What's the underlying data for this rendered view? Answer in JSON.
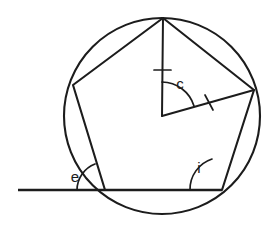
{
  "figure": {
    "type": "inscribed-regular-pentagon-with-angles",
    "background_color": "#ffffff",
    "stroke_color": "#1c1c1c"
  },
  "circle": {
    "center_x": 162,
    "center_y": 116,
    "radius": 98
  },
  "pentagon": {
    "vertex_count": 5,
    "vertices": [
      {
        "name": "apex",
        "x": 163,
        "y": 18
      },
      {
        "name": "upper-right",
        "x": 254,
        "y": 90
      },
      {
        "name": "lower-right",
        "x": 222,
        "y": 190
      },
      {
        "name": "lower-left",
        "x": 105,
        "y": 190
      },
      {
        "name": "upper-left",
        "x": 73,
        "y": 85
      }
    ]
  },
  "radii": [
    {
      "name": "radius-to-apex",
      "from_x": 162,
      "from_y": 116,
      "to_x": 163,
      "to_y": 18,
      "tick": true
    },
    {
      "name": "radius-to-upper-right",
      "from_x": 162,
      "from_y": 116,
      "to_x": 254,
      "to_y": 90,
      "tick": true
    }
  ],
  "baseline": {
    "name": "extended-base-ray",
    "from_x": 18,
    "from_y": 190,
    "to_x": 222,
    "to_y": 190
  },
  "angles": [
    {
      "id": "central",
      "label": "c",
      "label_x": 180,
      "label_y": 85,
      "vertex_x": 162,
      "vertex_y": 116,
      "arc_radius": 34,
      "description": "central angle at circle centre between two radii"
    },
    {
      "id": "exterior",
      "label": "e",
      "label_x": 75,
      "label_y": 178,
      "vertex_x": 105,
      "vertex_y": 190,
      "arc_radius": 28,
      "description": "exterior angle between extended baseline and pentagon side"
    },
    {
      "id": "interior",
      "label": "i",
      "label_x": 199,
      "label_y": 169,
      "vertex_x": 222,
      "vertex_y": 190,
      "arc_radius": 32,
      "description": "interior angle of pentagon at lower-right vertex"
    }
  ],
  "tick_marks": [
    {
      "name": "tick-on-vertical-radius",
      "x": 162,
      "y": 70,
      "angle_deg": 0
    },
    {
      "name": "tick-on-slanted-radius",
      "x": 209,
      "y": 102,
      "angle_deg": 74
    }
  ]
}
